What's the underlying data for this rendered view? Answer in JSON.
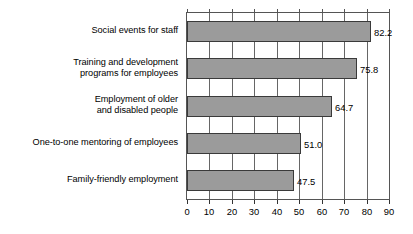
{
  "chart_data": {
    "type": "bar",
    "orientation": "horizontal",
    "title": "",
    "subtitle": "",
    "xlabel": "",
    "ylabel": "",
    "categories": [
      "Social events for staff",
      "Training and development programs for employees",
      "Employment of older and disabled people",
      "One-to-one mentoring of employees",
      "Family-friendly employment"
    ],
    "category_lines": [
      [
        "Social events for staff"
      ],
      [
        "Training and development",
        "programs for employees"
      ],
      [
        "Employment of older",
        "and disabled people"
      ],
      [
        "One-to-one mentoring of employees"
      ],
      [
        "Family-friendly employment"
      ]
    ],
    "values": [
      82.2,
      75.8,
      64.7,
      51.0,
      47.5
    ],
    "value_labels": [
      "82.2",
      "75.8",
      "64.7",
      "51.0",
      "47.5"
    ],
    "xlim": [
      0,
      90
    ],
    "xticks": [
      0,
      10,
      20,
      30,
      40,
      50,
      60,
      70,
      80,
      90
    ],
    "xtick_labels": [
      "0",
      "10",
      "20",
      "30",
      "40",
      "50",
      "60",
      "70",
      "80",
      "90"
    ],
    "grid": true,
    "grid_axis": "x",
    "legend": false,
    "legend_position": "none",
    "bar_color": "#9b9b9b",
    "bar_border_color": "#3a3a3a",
    "grid_color": "#666666",
    "axis_color": "#555555",
    "text_color": "#000000",
    "background": "#ffffff"
  }
}
